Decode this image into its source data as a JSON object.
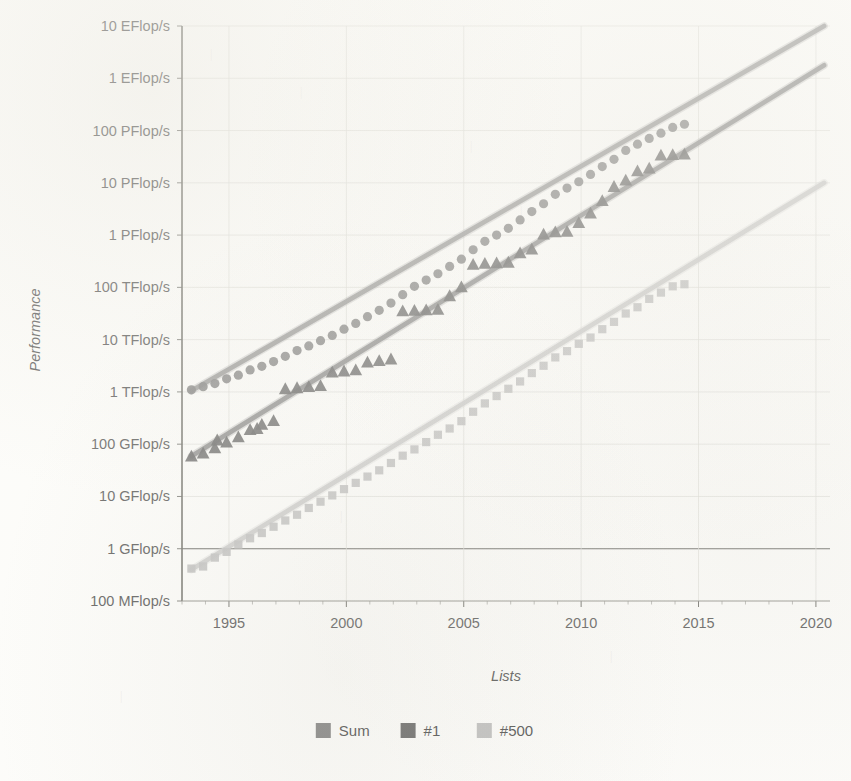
{
  "chart_data": {
    "type": "scatter",
    "title": "",
    "xlabel": "Lists",
    "ylabel": "Performance",
    "xlim": [
      1993.0,
      2020.6
    ],
    "ylim_flops": [
      100000000.0,
      1e+19
    ],
    "yscale": "log",
    "grid": true,
    "legend_position": "bottom",
    "xticks": [
      1995,
      2000,
      2005,
      2010,
      2015,
      2020
    ],
    "xtick_labels": [
      "1995",
      "2000",
      "2005",
      "2010",
      "2015",
      "2020"
    ],
    "xminor_step": 1,
    "yticks_labels": [
      "10 EFlop/s",
      "1 EFlop/s",
      "100 PFlop/s",
      "10 PFlop/s",
      "1 PFlop/s",
      "100 TFlop/s",
      "10 TFlop/s",
      "1 TFlop/s",
      "100 GFlop/s",
      "10 GFlop/s",
      "1 GFlop/s",
      "100 MFlop/s"
    ],
    "yticks_exponent": [
      19,
      18,
      17,
      16,
      15,
      14,
      13,
      12,
      11,
      10,
      9,
      8
    ],
    "zero_line_label": "1 GFlop/s",
    "series": [
      {
        "name": "Sum",
        "marker": "circle",
        "color": "#6e6e6e",
        "trend_color": "#8a8a8a",
        "trend_start": {
          "x": 1993.4,
          "y_exp": 12.02
        },
        "trend_end": {
          "x": 2020.35,
          "y_exp": 19.0
        },
        "points": [
          {
            "x": 1993.4,
            "y_exp": 12.04
          },
          {
            "x": 1993.9,
            "y_exp": 12.1
          },
          {
            "x": 1994.4,
            "y_exp": 12.16
          },
          {
            "x": 1994.9,
            "y_exp": 12.25
          },
          {
            "x": 1995.4,
            "y_exp": 12.32
          },
          {
            "x": 1995.9,
            "y_exp": 12.42
          },
          {
            "x": 1996.4,
            "y_exp": 12.49
          },
          {
            "x": 1996.9,
            "y_exp": 12.58
          },
          {
            "x": 1997.4,
            "y_exp": 12.68
          },
          {
            "x": 1997.9,
            "y_exp": 12.79
          },
          {
            "x": 1998.4,
            "y_exp": 12.88
          },
          {
            "x": 1998.9,
            "y_exp": 12.98
          },
          {
            "x": 1999.4,
            "y_exp": 13.08
          },
          {
            "x": 1999.9,
            "y_exp": 13.2
          },
          {
            "x": 2000.4,
            "y_exp": 13.31
          },
          {
            "x": 2000.9,
            "y_exp": 13.44
          },
          {
            "x": 2001.4,
            "y_exp": 13.56
          },
          {
            "x": 2001.9,
            "y_exp": 13.7
          },
          {
            "x": 2002.4,
            "y_exp": 13.86
          },
          {
            "x": 2002.9,
            "y_exp": 14.02
          },
          {
            "x": 2003.4,
            "y_exp": 14.14
          },
          {
            "x": 2003.9,
            "y_exp": 14.26
          },
          {
            "x": 2004.4,
            "y_exp": 14.4
          },
          {
            "x": 2004.9,
            "y_exp": 14.54
          },
          {
            "x": 2005.4,
            "y_exp": 14.72
          },
          {
            "x": 2005.9,
            "y_exp": 14.88
          },
          {
            "x": 2006.4,
            "y_exp": 15.0
          },
          {
            "x": 2006.9,
            "y_exp": 15.13
          },
          {
            "x": 2007.4,
            "y_exp": 15.29
          },
          {
            "x": 2007.9,
            "y_exp": 15.45
          },
          {
            "x": 2008.4,
            "y_exp": 15.6
          },
          {
            "x": 2008.9,
            "y_exp": 15.78
          },
          {
            "x": 2009.4,
            "y_exp": 15.9
          },
          {
            "x": 2009.9,
            "y_exp": 16.02
          },
          {
            "x": 2010.4,
            "y_exp": 16.16
          },
          {
            "x": 2010.9,
            "y_exp": 16.31
          },
          {
            "x": 2011.4,
            "y_exp": 16.45
          },
          {
            "x": 2011.9,
            "y_exp": 16.62
          },
          {
            "x": 2012.4,
            "y_exp": 16.74
          },
          {
            "x": 2012.9,
            "y_exp": 16.85
          },
          {
            "x": 2013.4,
            "y_exp": 16.95
          },
          {
            "x": 2013.9,
            "y_exp": 17.06
          },
          {
            "x": 2014.4,
            "y_exp": 17.12
          }
        ]
      },
      {
        "name": "#1",
        "marker": "triangle",
        "color": "#4f4f4f",
        "trend_color": "#7c7c7c",
        "trend_start": {
          "x": 1993.4,
          "y_exp": 10.77
        },
        "trend_end": {
          "x": 2020.35,
          "y_exp": 18.25
        },
        "points": [
          {
            "x": 1993.4,
            "y_exp": 10.77
          },
          {
            "x": 1993.9,
            "y_exp": 10.83
          },
          {
            "x": 1994.4,
            "y_exp": 10.93
          },
          {
            "x": 1994.5,
            "y_exp": 11.08
          },
          {
            "x": 1994.9,
            "y_exp": 11.04
          },
          {
            "x": 1995.4,
            "y_exp": 11.14
          },
          {
            "x": 1995.9,
            "y_exp": 11.28
          },
          {
            "x": 1996.2,
            "y_exp": 11.3
          },
          {
            "x": 1996.4,
            "y_exp": 11.38
          },
          {
            "x": 1996.9,
            "y_exp": 11.45
          },
          {
            "x": 1997.4,
            "y_exp": 12.06
          },
          {
            "x": 1997.9,
            "y_exp": 12.08
          },
          {
            "x": 1998.4,
            "y_exp": 12.1
          },
          {
            "x": 1998.9,
            "y_exp": 12.12
          },
          {
            "x": 1999.4,
            "y_exp": 12.38
          },
          {
            "x": 1999.9,
            "y_exp": 12.4
          },
          {
            "x": 2000.4,
            "y_exp": 12.42
          },
          {
            "x": 2000.9,
            "y_exp": 12.57
          },
          {
            "x": 2001.4,
            "y_exp": 12.6
          },
          {
            "x": 2001.9,
            "y_exp": 12.63
          },
          {
            "x": 2002.4,
            "y_exp": 13.55
          },
          {
            "x": 2002.9,
            "y_exp": 13.56
          },
          {
            "x": 2003.4,
            "y_exp": 13.57
          },
          {
            "x": 2003.9,
            "y_exp": 13.58
          },
          {
            "x": 2004.4,
            "y_exp": 13.84
          },
          {
            "x": 2004.9,
            "y_exp": 14.01
          },
          {
            "x": 2005.4,
            "y_exp": 14.44
          },
          {
            "x": 2005.9,
            "y_exp": 14.46
          },
          {
            "x": 2006.4,
            "y_exp": 14.47
          },
          {
            "x": 2006.9,
            "y_exp": 14.48
          },
          {
            "x": 2007.4,
            "y_exp": 14.66
          },
          {
            "x": 2007.9,
            "y_exp": 14.73
          },
          {
            "x": 2008.4,
            "y_exp": 15.02
          },
          {
            "x": 2008.9,
            "y_exp": 15.06
          },
          {
            "x": 2009.4,
            "y_exp": 15.07
          },
          {
            "x": 2009.9,
            "y_exp": 15.24
          },
          {
            "x": 2010.4,
            "y_exp": 15.42
          },
          {
            "x": 2010.9,
            "y_exp": 15.66
          },
          {
            "x": 2011.4,
            "y_exp": 15.93
          },
          {
            "x": 2011.9,
            "y_exp": 16.05
          },
          {
            "x": 2012.4,
            "y_exp": 16.23
          },
          {
            "x": 2012.9,
            "y_exp": 16.28
          },
          {
            "x": 2013.4,
            "y_exp": 16.53
          },
          {
            "x": 2013.9,
            "y_exp": 16.54
          },
          {
            "x": 2014.4,
            "y_exp": 16.55
          }
        ]
      },
      {
        "name": "#500",
        "marker": "square",
        "color": "#b4b4b4",
        "trend_color": "#c3c3c3",
        "trend_start": {
          "x": 1993.4,
          "y_exp": 8.6
        },
        "trend_end": {
          "x": 2020.35,
          "y_exp": 16.0
        },
        "points": [
          {
            "x": 1993.4,
            "y_exp": 8.62
          },
          {
            "x": 1993.9,
            "y_exp": 8.66
          },
          {
            "x": 1994.4,
            "y_exp": 8.83
          },
          {
            "x": 1994.9,
            "y_exp": 8.94
          },
          {
            "x": 1995.4,
            "y_exp": 9.08
          },
          {
            "x": 1995.9,
            "y_exp": 9.2
          },
          {
            "x": 1996.4,
            "y_exp": 9.3
          },
          {
            "x": 1996.9,
            "y_exp": 9.42
          },
          {
            "x": 1997.4,
            "y_exp": 9.54
          },
          {
            "x": 1997.9,
            "y_exp": 9.65
          },
          {
            "x": 1998.4,
            "y_exp": 9.78
          },
          {
            "x": 1998.9,
            "y_exp": 9.9
          },
          {
            "x": 1999.4,
            "y_exp": 10.02
          },
          {
            "x": 1999.9,
            "y_exp": 10.14
          },
          {
            "x": 2000.4,
            "y_exp": 10.26
          },
          {
            "x": 2000.9,
            "y_exp": 10.38
          },
          {
            "x": 2001.4,
            "y_exp": 10.5
          },
          {
            "x": 2001.9,
            "y_exp": 10.64
          },
          {
            "x": 2002.4,
            "y_exp": 10.78
          },
          {
            "x": 2002.9,
            "y_exp": 10.9
          },
          {
            "x": 2003.4,
            "y_exp": 11.04
          },
          {
            "x": 2003.9,
            "y_exp": 11.18
          },
          {
            "x": 2004.4,
            "y_exp": 11.3
          },
          {
            "x": 2004.9,
            "y_exp": 11.44
          },
          {
            "x": 2005.4,
            "y_exp": 11.62
          },
          {
            "x": 2005.9,
            "y_exp": 11.78
          },
          {
            "x": 2006.4,
            "y_exp": 11.92
          },
          {
            "x": 2006.9,
            "y_exp": 12.06
          },
          {
            "x": 2007.4,
            "y_exp": 12.2
          },
          {
            "x": 2007.9,
            "y_exp": 12.36
          },
          {
            "x": 2008.4,
            "y_exp": 12.5
          },
          {
            "x": 2008.9,
            "y_exp": 12.66
          },
          {
            "x": 2009.4,
            "y_exp": 12.78
          },
          {
            "x": 2009.9,
            "y_exp": 12.92
          },
          {
            "x": 2010.4,
            "y_exp": 13.04
          },
          {
            "x": 2010.9,
            "y_exp": 13.2
          },
          {
            "x": 2011.4,
            "y_exp": 13.34
          },
          {
            "x": 2011.9,
            "y_exp": 13.5
          },
          {
            "x": 2012.4,
            "y_exp": 13.62
          },
          {
            "x": 2012.9,
            "y_exp": 13.78
          },
          {
            "x": 2013.4,
            "y_exp": 13.9
          },
          {
            "x": 2013.9,
            "y_exp": 14.02
          },
          {
            "x": 2014.4,
            "y_exp": 14.06
          }
        ]
      }
    ]
  },
  "legend": {
    "items": [
      {
        "label": "Sum",
        "color": "#6e6e6e"
      },
      {
        "label": "#1",
        "color": "#4f4f4f"
      },
      {
        "label": "#500",
        "color": "#b4b4b4"
      }
    ]
  },
  "axis": {
    "y_title": "Performance",
    "x_title": "Lists"
  },
  "colors": {
    "background": "#fdfdfb",
    "grid": "#d8d8d2",
    "axis": "#55554f",
    "text": "#3a3a3a"
  }
}
